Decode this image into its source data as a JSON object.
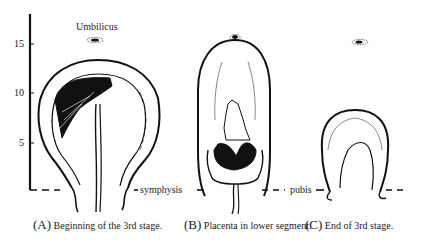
{
  "figure": {
    "axis": {
      "ticks": [
        {
          "value": "15",
          "y": 44
        },
        {
          "value": "10",
          "y": 93
        },
        {
          "value": "5",
          "y": 143
        }
      ],
      "baseline_y": 190
    },
    "annotations": {
      "umbilicus": "Umbilicus",
      "symphysis": "symphysis",
      "pubis": "pubis"
    },
    "panels": [
      {
        "letter": "(A)",
        "caption": "Beginning of the 3rd stage."
      },
      {
        "letter": "(B)",
        "caption": "Placenta in lower segment."
      },
      {
        "letter": "(C)",
        "caption": "End of 3rd stage."
      }
    ],
    "colors": {
      "ink": "#111111",
      "background": "#ffffff"
    }
  }
}
